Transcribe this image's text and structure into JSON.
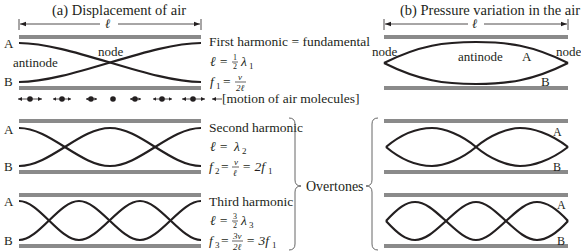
{
  "panel_a": {
    "title": "(a)   Displacement of air",
    "length_symbol": "ℓ",
    "tubes": [
      {
        "end_label_top": "A",
        "end_label_bottom": "B",
        "inner_labels": {
          "antinode": "antinode",
          "node": "node"
        },
        "name": "First harmonic = fundamental",
        "eq1_lhs": "ℓ =",
        "eq1_num": "1",
        "eq1_den": "2",
        "eq1_rhs": "λ",
        "eq1_sub": "1",
        "eq2_lhs": "f",
        "eq2_lhs_sub": "1",
        "eq2_eq": "=",
        "eq2_num": "v",
        "eq2_den": "2ℓ",
        "eq2_tail": ""
      },
      {
        "end_label_top": "A",
        "end_label_bottom": "B",
        "name": "Second harmonic",
        "eq1_lhs": "ℓ =",
        "eq1_rhs": "λ",
        "eq1_sub": "2",
        "eq2_lhs": "f",
        "eq2_lhs_sub": "2",
        "eq2_eq": "=",
        "eq2_num": "v",
        "eq2_den": "ℓ",
        "eq2_tail": "= 2f",
        "eq2_tail_sub": "1"
      },
      {
        "end_label_top": "A",
        "end_label_bottom": "B",
        "name": "Third harmonic",
        "eq1_lhs": "ℓ =",
        "eq1_num": "3",
        "eq1_den": "2",
        "eq1_rhs": "λ",
        "eq1_sub": "3",
        "eq2_lhs": "f",
        "eq2_lhs_sub": "3",
        "eq2_eq": "=",
        "eq2_num": "3v",
        "eq2_den": "2ℓ",
        "eq2_tail": "= 3f",
        "eq2_tail_sub": "1"
      }
    ],
    "molecule_motion_label": "[motion of air molecules]"
  },
  "overtones_label": "Overtones",
  "panel_b": {
    "title": "(b)   Pressure variation in the air",
    "length_symbol": "ℓ",
    "tubes": [
      {
        "left_label": "node",
        "right_label": "node",
        "center_label": "antinode",
        "label_a": "A",
        "label_b": "B"
      },
      {
        "label_a": "A",
        "label_b": "B"
      },
      {
        "label_a": "A",
        "label_b": "B"
      }
    ]
  },
  "colors": {
    "tube_wall": "#8a8a8a",
    "wave": "#231f20",
    "text": "#231f20"
  }
}
